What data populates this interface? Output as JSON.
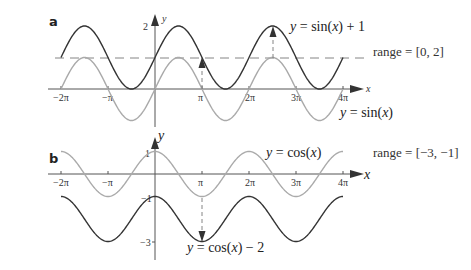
{
  "chart_data": [
    {
      "panel": "a",
      "type": "line",
      "title": "",
      "xlabel": "x",
      "ylabel": "y",
      "x_ticks": [
        "−2π",
        "−π",
        "π",
        "2π",
        "3π",
        "4π"
      ],
      "y_ticks": [
        "2"
      ],
      "xlim": [
        "-2π",
        "4π"
      ],
      "grid": false,
      "series": [
        {
          "name": "y = sin(x) + 1",
          "color": "#333333",
          "formula": "sin(x)+1",
          "range": [
            0,
            2
          ]
        },
        {
          "name": "y = sin(x)",
          "color": "#aaaaaa",
          "formula": "sin(x)",
          "range": [
            -1,
            1
          ]
        }
      ],
      "annotations": {
        "dashed_line_y": 1,
        "arrows": [
          "up from y=0 to y=1 at x=π",
          "up from y=1 to y=2 at x=5π/2"
        ],
        "range_label": "range = [0, 2]"
      }
    },
    {
      "panel": "b",
      "type": "line",
      "title": "",
      "xlabel": "x",
      "ylabel": "y",
      "x_ticks": [
        "−2π",
        "−π",
        "π",
        "2π",
        "3π",
        "4π"
      ],
      "y_ticks": [
        "1",
        "−1",
        "−3"
      ],
      "xlim": [
        "-2π",
        "4π"
      ],
      "grid": false,
      "series": [
        {
          "name": "y = cos(x)",
          "color": "#aaaaaa",
          "formula": "cos(x)",
          "range": [
            -1,
            1
          ]
        },
        {
          "name": "y = cos(x) − 2",
          "color": "#333333",
          "formula": "cos(x)-2",
          "range": [
            -3,
            -1
          ]
        }
      ],
      "annotations": {
        "arrows": [
          "down from y=-1 to y=-3 at x=π"
        ],
        "range_label": "range = [−3, −1]"
      }
    }
  ],
  "panels": {
    "a": {
      "label": "a",
      "x_axis_label": "x",
      "y_axis_label": "y",
      "y_tick_2": "2",
      "ticks": {
        "m2pi": "−2π",
        "mpi": "−π",
        "pi": "π",
        "2pi": "2π",
        "3pi": "3π",
        "4pi": "4π"
      },
      "eq_top_y": "y",
      "eq_top_eq": " = ",
      "eq_top_rhs_pre": "sin(",
      "eq_top_x": "x",
      "eq_top_rhs_post": ") + 1",
      "eq_bottom_y": "y",
      "eq_bottom_eq": " = ",
      "eq_bottom_rhs_pre": "sin(",
      "eq_bottom_x": "x",
      "eq_bottom_rhs_post": ")",
      "range": "range = [0, 2]"
    },
    "b": {
      "label": "b",
      "x_axis_label": "x",
      "y_axis_label": "y",
      "y_tick_1": "1",
      "y_tick_m1": "−1",
      "y_tick_m3": "−3",
      "ticks": {
        "m2pi": "−2π",
        "mpi": "−π",
        "pi": "π",
        "2pi": "2π",
        "3pi": "3π",
        "4pi": "4π"
      },
      "eq_top_y": "y",
      "eq_top_eq": " = ",
      "eq_top_rhs_pre": "cos(",
      "eq_top_x": "x",
      "eq_top_rhs_post": ")",
      "eq_bottom_y": "y",
      "eq_bottom_eq": " = ",
      "eq_bottom_rhs_pre": "cos(",
      "eq_bottom_x": "x",
      "eq_bottom_rhs_post": ") − 2",
      "range": "range = [−3, −1]"
    }
  },
  "colors": {
    "dark_curve": "#333333",
    "light_curve": "#aaaaaa",
    "axis": "#555555"
  }
}
